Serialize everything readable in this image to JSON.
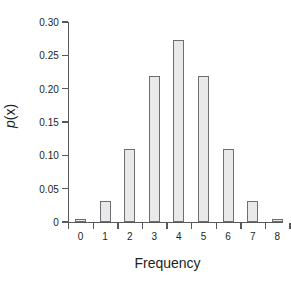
{
  "chart_data": {
    "type": "bar",
    "title": "",
    "subtitle": "",
    "xlabel": "Frequency",
    "ylabel": "p(x)",
    "ylabel_italic_part": "p",
    "ylabel_rest": "(x)",
    "categories": [
      "0",
      "1",
      "2",
      "3",
      "4",
      "5",
      "6",
      "7",
      "8"
    ],
    "values": [
      0.004,
      0.031,
      0.109,
      0.219,
      0.273,
      0.219,
      0.109,
      0.031,
      0.004
    ],
    "ylim": [
      0,
      0.3
    ],
    "xlim": [
      -0.5,
      8.5
    ],
    "ytick_values": [
      0,
      0.05,
      0.1,
      0.15,
      0.2,
      0.25,
      0.3
    ],
    "ytick_labels": [
      "0",
      "0.05",
      "0.10",
      "0.15",
      "0.20",
      "0.25",
      "0.30"
    ],
    "xtick_labels": [
      "0",
      "1",
      "2",
      "3",
      "4",
      "5",
      "6",
      "7",
      "8"
    ],
    "grid": false,
    "legend": null,
    "legend_position": "none",
    "bar_fill_color": "#e9e9e9",
    "bar_edge_color": "#6d6e71",
    "axis_color": "#58595b",
    "text_color": "#231f20",
    "background_color": "#ffffff"
  }
}
